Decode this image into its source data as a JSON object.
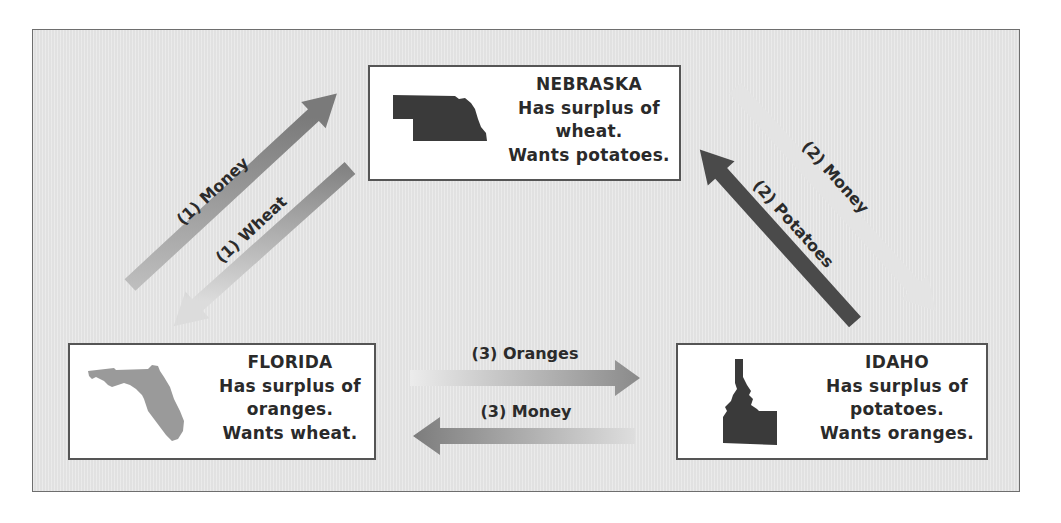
{
  "diagram": {
    "type": "barter-trade-cycle",
    "states": [
      {
        "id": "nebraska",
        "name": "NEBRASKA",
        "lines": [
          "Has surplus of",
          "wheat.",
          "Wants potatoes."
        ],
        "silhouette_color": "#3a3a3a"
      },
      {
        "id": "florida",
        "name": "FLORIDA",
        "lines": [
          "Has surplus of",
          "oranges.",
          "Wants wheat."
        ],
        "silhouette_color": "#9a9a9a"
      },
      {
        "id": "idaho",
        "name": "IDAHO",
        "lines": [
          "Has surplus of",
          "potatoes.",
          "Wants oranges."
        ],
        "silhouette_color": "#3a3a3a"
      }
    ],
    "flows": [
      {
        "label": "(1) Money",
        "from": "florida",
        "to": "nebraska"
      },
      {
        "label": "(1) Wheat",
        "from": "nebraska",
        "to": "florida"
      },
      {
        "label": "(2) Money",
        "from": "nebraska",
        "to": "idaho"
      },
      {
        "label": "(2) Potatoes",
        "from": "idaho",
        "to": "nebraska"
      },
      {
        "label": "(3) Oranges",
        "from": "florida",
        "to": "idaho"
      },
      {
        "label": "(3) Money",
        "from": "idaho",
        "to": "florida"
      }
    ]
  },
  "colors": {
    "background": "#e6e6e6",
    "frame_border": "#6e6e6e",
    "box_border": "#555555",
    "text": "#2a2a2a",
    "arrow_dark": "#595959",
    "arrow_light": "#dcdcdc"
  }
}
